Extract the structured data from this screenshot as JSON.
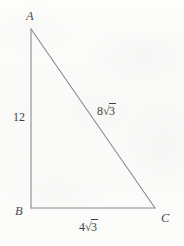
{
  "figure": {
    "type": "right-triangle-diagram",
    "vertices": [
      {
        "name": "A",
        "label": "A",
        "x": 31,
        "y": 29
      },
      {
        "name": "B",
        "label": "B",
        "x": 31,
        "y": 208
      },
      {
        "name": "C",
        "label": "C",
        "x": 155,
        "y": 208
      }
    ],
    "sides": [
      {
        "name": "AB",
        "label": "12",
        "label_plain": "12",
        "position": "left"
      },
      {
        "name": "AC",
        "label": "8√3",
        "coefficient": "8",
        "radicand": "3",
        "position": "hypotenuse"
      },
      {
        "name": "BC",
        "label": "4√3",
        "coefficient": "4",
        "radicand": "3",
        "position": "bottom"
      }
    ],
    "colors": {
      "line": "#8a8a8a",
      "text": "#3f3f3f",
      "vertex_text": "#4a4a4a",
      "background": "#fbfbfa"
    }
  }
}
